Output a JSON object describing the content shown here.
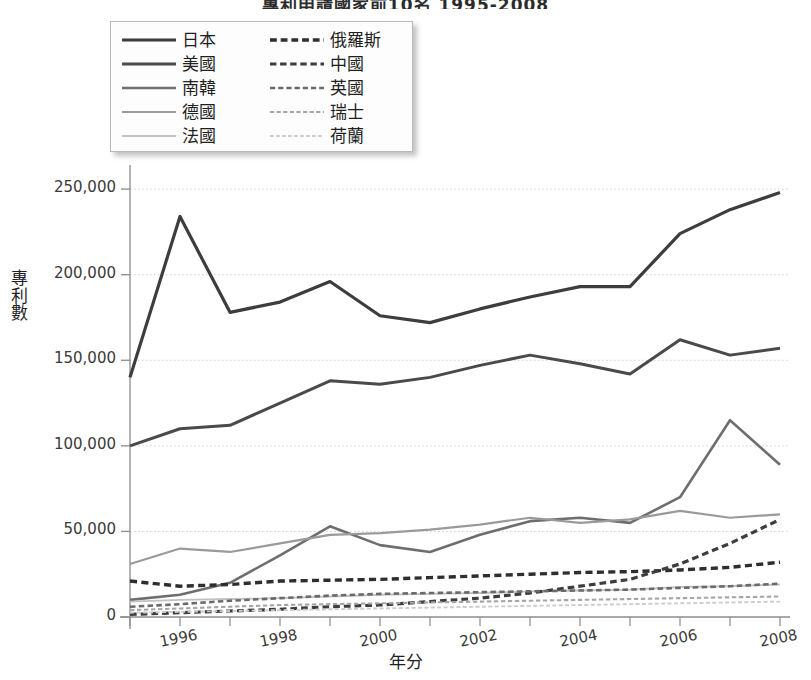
{
  "title": "專利申請國家前10名 1995-2008",
  "axis": {
    "ylabel": "專利數",
    "xlabel": "年分",
    "yticks": [
      "0",
      "50,000",
      "100,000",
      "150,000",
      "200,000",
      "250,000"
    ],
    "xticks": [
      "1996",
      "1998",
      "2000",
      "2002",
      "2004",
      "2006",
      "2008"
    ]
  },
  "legend": {
    "left": [
      {
        "label": "日本",
        "color": "#3d3d3d",
        "style": "solid",
        "width": 3.2
      },
      {
        "label": "美國",
        "color": "#4a4a4a",
        "style": "solid",
        "width": 3.0
      },
      {
        "label": "南韓",
        "color": "#6e6e6e",
        "style": "solid",
        "width": 2.6
      },
      {
        "label": "德國",
        "color": "#9a9a9a",
        "style": "solid",
        "width": 2.2
      },
      {
        "label": "法國",
        "color": "#c2c2c2",
        "style": "solid",
        "width": 1.9
      }
    ],
    "right": [
      {
        "label": "俄羅斯",
        "color": "#2e2e2e",
        "style": "dashed",
        "width": 3.4
      },
      {
        "label": "中國",
        "color": "#3d3d3d",
        "style": "dashed",
        "width": 3.2
      },
      {
        "label": "英國",
        "color": "#6b6b6b",
        "style": "dashed",
        "width": 2.6
      },
      {
        "label": "瑞士",
        "color": "#a6a6a6",
        "style": "dashed",
        "width": 2.1
      },
      {
        "label": "荷蘭",
        "color": "#cccccc",
        "style": "dashed",
        "width": 1.9
      }
    ]
  },
  "chart_data": {
    "type": "line",
    "title": "專利申請國家前10名 1995-2008",
    "xlabel": "年分",
    "ylabel": "專利數",
    "x": [
      1995,
      1996,
      1997,
      1998,
      1999,
      2000,
      2001,
      2002,
      2003,
      2004,
      2005,
      2006,
      2007,
      2008
    ],
    "xlim": [
      1995,
      2008
    ],
    "ylim": [
      0,
      260000
    ],
    "yticks": [
      0,
      50000,
      100000,
      150000,
      200000,
      250000
    ],
    "grid": "horizontal-dotted",
    "legend_position": "top-left-overlay",
    "series": [
      {
        "name": "日本",
        "color": "#3d3d3d",
        "style": "solid",
        "width": 3.2,
        "values": [
          140000,
          234000,
          178000,
          184000,
          196000,
          176000,
          172000,
          180000,
          187000,
          193000,
          193000,
          224000,
          238000,
          248000
        ]
      },
      {
        "name": "美國",
        "color": "#4a4a4a",
        "style": "solid",
        "width": 3.0,
        "values": [
          100000,
          110000,
          112000,
          125000,
          138000,
          136000,
          140000,
          147000,
          153000,
          148000,
          142000,
          162000,
          153000,
          157000
        ]
      },
      {
        "name": "南韓",
        "color": "#6e6e6e",
        "style": "solid",
        "width": 2.6,
        "values": [
          10000,
          13000,
          20000,
          36000,
          53000,
          42000,
          38000,
          48000,
          56000,
          58000,
          55000,
          70000,
          115000,
          89000
        ]
      },
      {
        "name": "德國",
        "color": "#9a9a9a",
        "style": "solid",
        "width": 2.2,
        "values": [
          31000,
          40000,
          38000,
          43000,
          48000,
          49000,
          51000,
          54000,
          58000,
          55000,
          57000,
          62000,
          58000,
          60000
        ]
      },
      {
        "name": "法國",
        "color": "#c2c2c2",
        "style": "solid",
        "width": 1.9,
        "values": [
          9000,
          10000,
          10500,
          11000,
          12000,
          13000,
          13500,
          14000,
          15000,
          15500,
          16000,
          17500,
          18000,
          19000
        ]
      },
      {
        "name": "俄羅斯",
        "color": "#2e2e2e",
        "style": "dashed",
        "width": 3.4,
        "values": [
          21000,
          18000,
          19000,
          21000,
          21500,
          22000,
          23000,
          24000,
          25000,
          26000,
          26500,
          27500,
          29000,
          32000
        ]
      },
      {
        "name": "中國",
        "color": "#3d3d3d",
        "style": "dashed",
        "width": 3.2,
        "values": [
          1500,
          2500,
          3500,
          4500,
          6000,
          7000,
          9000,
          11000,
          14000,
          18000,
          22000,
          31000,
          43000,
          57000
        ]
      },
      {
        "name": "英國",
        "color": "#6b6b6b",
        "style": "dashed",
        "width": 2.6,
        "values": [
          6000,
          7500,
          9500,
          11000,
          12500,
          13500,
          14000,
          14500,
          15000,
          15500,
          16000,
          17000,
          18000,
          19500
        ]
      },
      {
        "name": "瑞士",
        "color": "#a6a6a6",
        "style": "dashed",
        "width": 2.1,
        "values": [
          4000,
          5000,
          6000,
          7000,
          7500,
          8000,
          8500,
          9000,
          9500,
          10000,
          10500,
          11000,
          11500,
          12000
        ]
      },
      {
        "name": "荷蘭",
        "color": "#cccccc",
        "style": "dashed",
        "width": 1.9,
        "values": [
          2500,
          3000,
          3500,
          4000,
          4500,
          5000,
          5500,
          6000,
          6500,
          7000,
          7500,
          8000,
          8500,
          9000
        ]
      }
    ]
  }
}
